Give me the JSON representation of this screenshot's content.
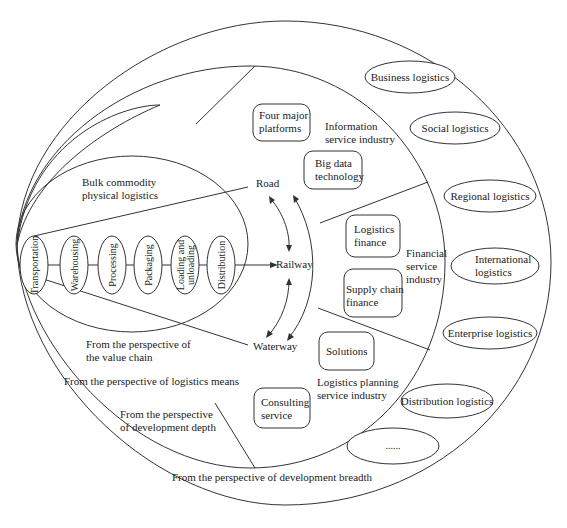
{
  "diagram": {
    "colors": {
      "line": "#333333",
      "text": "#222222",
      "background": "#ffffff"
    },
    "perspectives": {
      "value_chain": [
        "From the perspective of",
        "the value chain"
      ],
      "logistics_means": "From the perspective of logistics means",
      "development_depth": [
        "From the perspective",
        "of development depth"
      ],
      "development_breadth": "From the perspective of development breadth"
    },
    "value_chain": {
      "title": [
        "Bulk commodity",
        "physical logistics"
      ],
      "steps": [
        [
          "Transportation"
        ],
        [
          "Warehousing"
        ],
        [
          "Processing"
        ],
        [
          "Packaging"
        ],
        [
          "Loading and",
          "unloading"
        ],
        [
          "Distribution"
        ]
      ]
    },
    "logistics_means": {
      "road": "Road",
      "railway": "Railway",
      "waterway": "Waterway"
    },
    "depth": {
      "information_service": {
        "label": [
          "Information",
          "service industry"
        ],
        "boxes": [
          [
            "Four major",
            "platforms"
          ],
          [
            "Big data",
            "technology"
          ]
        ]
      },
      "financial_service": {
        "label": [
          "Financial",
          "service",
          "industry"
        ],
        "boxes": [
          [
            "Logistics",
            "finance"
          ],
          [
            "Supply chain",
            "finance"
          ]
        ]
      },
      "planning_service": {
        "label": [
          "Logistics planning",
          "service industry"
        ],
        "boxes": [
          [
            "Solutions"
          ],
          [
            "Consulting",
            "service"
          ]
        ]
      }
    },
    "breadth": {
      "items": [
        "Business logistics",
        "Social logistics",
        "Regional logistics",
        [
          "International",
          "logistics"
        ],
        "Enterprise logistics",
        "Distribution logistics",
        "......"
      ]
    }
  }
}
